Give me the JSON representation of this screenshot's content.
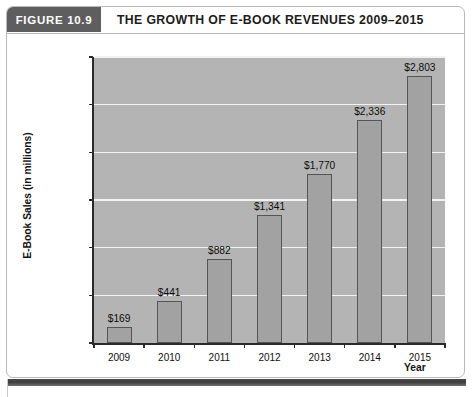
{
  "figure": {
    "tag": "FIGURE 10.9",
    "title": "THE GROWTH OF E-BOOK REVENUES 2009–2015"
  },
  "chart_data": {
    "type": "bar",
    "title": "THE GROWTH OF E-BOOK REVENUES 2009–2015",
    "categories": [
      "2009",
      "2010",
      "2011",
      "2012",
      "2013",
      "2014",
      "2015"
    ],
    "values": [
      169,
      441,
      882,
      1341,
      1770,
      2336,
      2803
    ],
    "data_labels": [
      "$169",
      "$441",
      "$882",
      "$1,341",
      "$1,770",
      "$2,336",
      "$2,803"
    ],
    "xlabel": "Year",
    "ylabel": "E-Book Sales (in millions)",
    "ylim": [
      0,
      3000
    ],
    "ytick_values": [
      0,
      500,
      1000,
      1500,
      2000,
      2500,
      3000
    ],
    "ytick_labels": [
      "0",
      "$500",
      "$1,000",
      "$1,500",
      "$2,000",
      "$2,500",
      "$3,000"
    ],
    "grid": "horizontal",
    "legend": "none",
    "colors": {
      "plot_background": "#b4b4b4",
      "bar_fill": "#a2a2a2",
      "bar_border": "#555555",
      "gridline": "#f2f2f2",
      "axis": "#2a2a2a",
      "header_tag_background": "#5e5e5e",
      "header_tag_text": "#ffffff",
      "title_text": "#1c1c1c"
    }
  }
}
